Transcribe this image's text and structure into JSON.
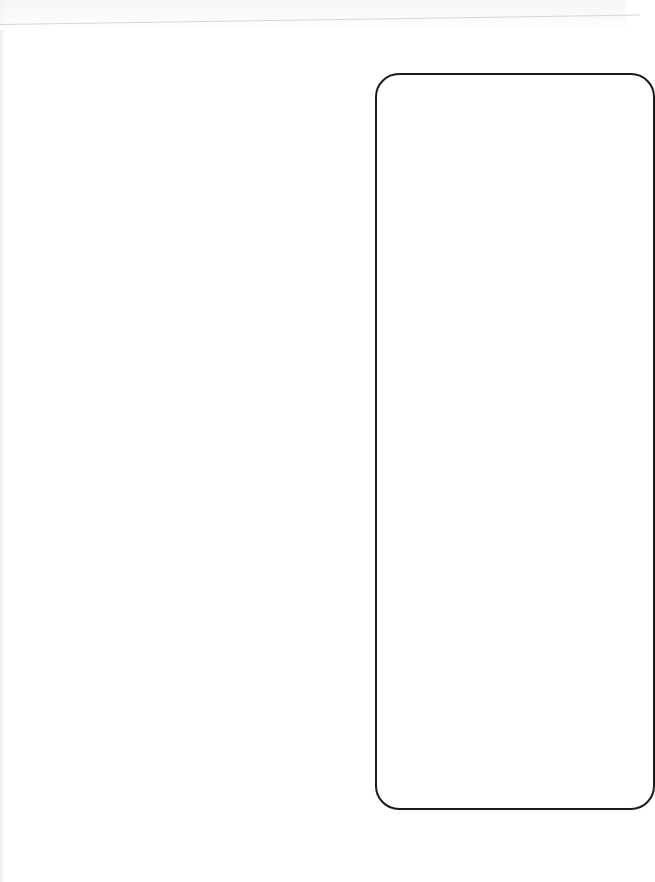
{
  "page": {
    "background": "#ffffff",
    "frame_color": "#1a1a1a",
    "rule_color": "#d6d6d6",
    "content": ""
  },
  "frame": {
    "text": ""
  }
}
